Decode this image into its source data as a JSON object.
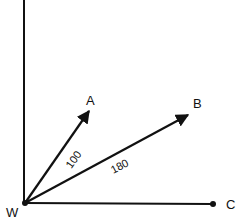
{
  "diagram": {
    "type": "vector-diagram",
    "origin": {
      "label": "W",
      "x": 25,
      "y": 203
    },
    "points": [
      {
        "id": "A",
        "label": "A",
        "x": 89,
        "y": 111
      },
      {
        "id": "B",
        "label": "B",
        "x": 188,
        "y": 115
      },
      {
        "id": "C",
        "label": "C",
        "x": 213,
        "y": 204
      }
    ],
    "vectors": [
      {
        "from": "W",
        "to": "A",
        "magnitude_label": "100",
        "arrow": true
      },
      {
        "from": "W",
        "to": "B",
        "magnitude_label": "180",
        "arrow": true
      },
      {
        "from": "W",
        "to": "C",
        "magnitude_label": "",
        "arrow": false,
        "end_dot": true
      }
    ],
    "vertical_axis": {
      "x": 24,
      "from_y": 0,
      "to_y": 203
    },
    "colors": {
      "line": "#111111",
      "background": "#ffffff"
    }
  }
}
